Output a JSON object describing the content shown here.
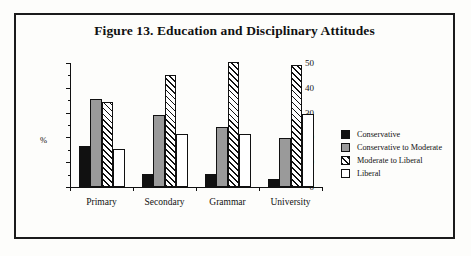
{
  "figure": {
    "title": "Figure 13. Education and Disciplinary Attitudes"
  },
  "chart_data": {
    "type": "bar",
    "title": "Figure 13. Education and Disciplinary Attitudes",
    "xlabel": "",
    "ylabel": "%",
    "ylim": [
      0,
      50
    ],
    "yticks": [
      0,
      10,
      20,
      30,
      40,
      50
    ],
    "ytick_labels": [
      "0",
      "10",
      "20",
      "30",
      "40",
      "50"
    ],
    "minor_tick_step": 5,
    "grid": false,
    "legend_position": "right",
    "categories": [
      "Primary",
      "Secondary",
      "Grammar",
      "University"
    ],
    "series": [
      {
        "name": "Conservative",
        "swatch": "solid-black",
        "color": "#111111",
        "values": [
          16.5,
          5.2,
          5.4,
          3.2
        ]
      },
      {
        "name": "Conservative to Moderate",
        "swatch": "solid-gray",
        "color": "#9a9a9a",
        "values": [
          35.3,
          29.1,
          24.3,
          19.8
        ]
      },
      {
        "name": "Moderate to Liberal",
        "swatch": "diagonal-hatch",
        "color": "#ffffff",
        "values": [
          34.3,
          45.2,
          50.5,
          49.0
        ]
      },
      {
        "name": "Liberal",
        "swatch": "solid-white",
        "color": "#ffffff",
        "values": [
          15.4,
          21.2,
          21.2,
          29.3
        ]
      }
    ]
  }
}
